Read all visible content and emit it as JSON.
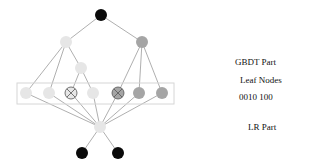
{
  "labels": {
    "gbdt": "GBDT Part",
    "leaf_nodes": "Leaf Nodes",
    "leaf_code": "0010 100",
    "lr": "LR Part"
  },
  "colors": {
    "black": "#0a0a0a",
    "light": "#e6e6e6",
    "mid": "#a5a5a5",
    "edge": "#9a9a9a",
    "box": "#d6d6d6"
  },
  "tree": {
    "root": {
      "x": 101,
      "y": 15,
      "color": "black"
    },
    "level1": [
      {
        "x": 66,
        "y": 42,
        "color": "light"
      },
      {
        "x": 142,
        "y": 42,
        "color": "mid"
      }
    ],
    "level2": [
      {
        "x": 81,
        "y": 68,
        "color": "light"
      }
    ],
    "leaves": [
      {
        "x": 26,
        "y": 93,
        "color": "light",
        "crossed": false,
        "bit": "0"
      },
      {
        "x": 49,
        "y": 93,
        "color": "light",
        "crossed": false,
        "bit": "0"
      },
      {
        "x": 71,
        "y": 93,
        "color": "light",
        "crossed": true,
        "bit": "1"
      },
      {
        "x": 93,
        "y": 93,
        "color": "light",
        "crossed": false,
        "bit": "0"
      },
      {
        "x": 118,
        "y": 93,
        "color": "mid",
        "crossed": true,
        "bit": "1"
      },
      {
        "x": 139,
        "y": 93,
        "color": "mid",
        "crossed": false,
        "bit": "0"
      },
      {
        "x": 162,
        "y": 93,
        "color": "mid",
        "crossed": false,
        "bit": "0"
      }
    ],
    "lr_node": {
      "x": 100,
      "y": 127,
      "color": "light"
    },
    "outputs": [
      {
        "x": 82,
        "y": 153,
        "color": "black"
      },
      {
        "x": 118,
        "y": 153,
        "color": "black"
      }
    ]
  }
}
